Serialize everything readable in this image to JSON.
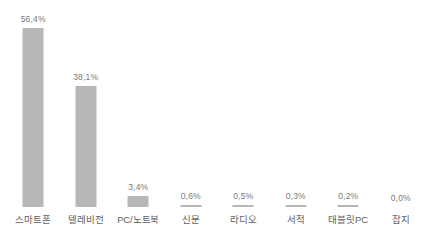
{
  "chart_data": {
    "type": "bar",
    "title": "",
    "subtitle": "",
    "xlabel": "",
    "ylabel": "",
    "ylim": [
      0,
      60
    ],
    "grid": false,
    "legend": null,
    "categories": [
      "스마트폰",
      "텔레비전",
      "PC/노트북",
      "신문",
      "라디오",
      "서적",
      "태블릿PC",
      "잡지"
    ],
    "values": [
      56.4,
      38.1,
      3.4,
      0.6,
      0.5,
      0.3,
      0.2,
      0.0
    ],
    "value_labels": [
      "56,4%",
      "38,1%",
      "3,4%",
      "0,6%",
      "0,5%",
      "0,3%",
      "0,2%",
      "0,0%"
    ],
    "bar_color": "#b7b7b7",
    "value_label_color": "#7a7a7a",
    "category_label_color": "#5f5f5f",
    "background_color": "#ffffff"
  }
}
